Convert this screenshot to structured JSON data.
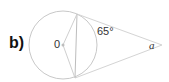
{
  "diagram": {
    "part_label": "b)",
    "center_label": "0",
    "given_angle": "65°",
    "unknown_angle": "a",
    "colors": {
      "stroke": "#c8c8c8",
      "text": "#333333",
      "part_label": "#111111"
    }
  }
}
